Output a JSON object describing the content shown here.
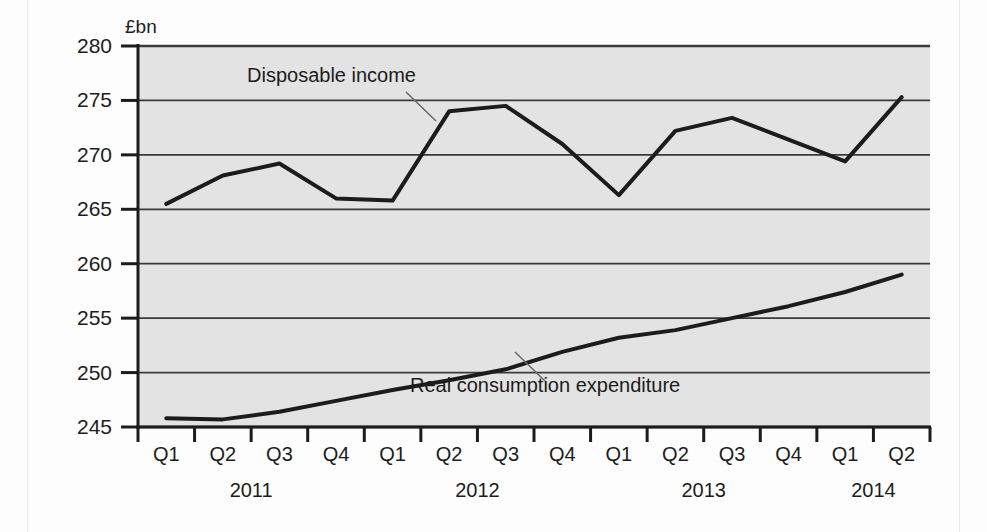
{
  "chart_data": {
    "type": "line",
    "title": "",
    "subtitle": "",
    "xlabel": "",
    "ylabel": "£bn",
    "unit_label": "£bn",
    "ylim": [
      245,
      280
    ],
    "ytick_values": [
      245,
      250,
      255,
      260,
      265,
      270,
      275,
      280
    ],
    "ytick_labels": [
      "245",
      "250",
      "255",
      "260",
      "265",
      "270",
      "275",
      "280"
    ],
    "grid": true,
    "grid_axis": "y",
    "legend_position": "inline-annotation",
    "categories": [
      "Q1",
      "Q2",
      "Q3",
      "Q4",
      "Q1",
      "Q2",
      "Q3",
      "Q4",
      "Q1",
      "Q2",
      "Q3",
      "Q4",
      "Q1",
      "Q2"
    ],
    "year_groups": [
      {
        "label": "2011",
        "start_index": 0,
        "end_index": 3
      },
      {
        "label": "2012",
        "start_index": 4,
        "end_index": 7
      },
      {
        "label": "2013",
        "start_index": 8,
        "end_index": 11
      },
      {
        "label": "2014",
        "start_index": 12,
        "end_index": 13
      }
    ],
    "series": [
      {
        "name": "Disposable income",
        "color": "#1c1c1c",
        "values": [
          265.5,
          268.1,
          269.2,
          266.0,
          265.8,
          274.0,
          274.5,
          271.0,
          266.3,
          272.2,
          273.4,
          271.4,
          269.4,
          275.3
        ]
      },
      {
        "name": "Real consumption expenditure",
        "color": "#1c1c1c",
        "values": [
          245.8,
          245.7,
          246.4,
          247.4,
          248.4,
          249.3,
          250.3,
          251.9,
          253.2,
          253.9,
          255.0,
          256.1,
          257.4,
          259.0
        ]
      }
    ],
    "annotations": [
      {
        "text": "Disposable income",
        "series": "Disposable income",
        "text_x": 247,
        "text_y": 82,
        "leader_from_x": 406,
        "leader_from_y": 92,
        "leader_to_x": 436,
        "leader_to_y": 121
      },
      {
        "text": "Real consumption expenditure",
        "series": "Real consumption expenditure",
        "text_x": 410,
        "text_y": 392,
        "leader_from_x": 545,
        "leader_from_y": 381,
        "leader_to_x": 515,
        "leader_to_y": 352
      }
    ],
    "colors": {
      "plot_background": "#e3e3e3",
      "gridline": "#3a3a3a",
      "axis": "#1c1c1c",
      "line": "#1c1c1c",
      "page_background": "#fdfdfd"
    }
  }
}
